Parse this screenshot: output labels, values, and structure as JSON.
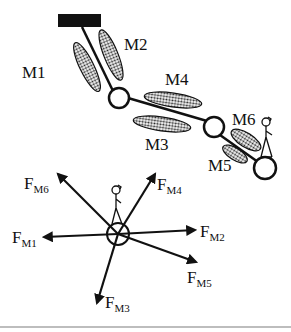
{
  "diagram": {
    "type": "arm-muscle-force-diagram",
    "colors": {
      "ink": "#111111",
      "muscle_fill": "#9a9a9a",
      "background": "#ffffff",
      "rule": "#bdbdbd"
    },
    "arm": {
      "anchor": "base-block",
      "joints": [
        "shoulder",
        "elbow",
        "endpoint"
      ],
      "muscles": [
        {
          "id": "M1",
          "label": "M1"
        },
        {
          "id": "M2",
          "label": "M2"
        },
        {
          "id": "M3",
          "label": "M3"
        },
        {
          "id": "M4",
          "label": "M4"
        },
        {
          "id": "M5",
          "label": "M5"
        },
        {
          "id": "M6",
          "label": "M6"
        }
      ]
    },
    "forces": {
      "prefix": "F",
      "vectors": [
        {
          "id": "FM6",
          "main": "F",
          "sub": "M6"
        },
        {
          "id": "FM4",
          "main": "F",
          "sub": "M4"
        },
        {
          "id": "FM1",
          "main": "F",
          "sub": "M1"
        },
        {
          "id": "FM2",
          "main": "F",
          "sub": "M2"
        },
        {
          "id": "FM5",
          "main": "F",
          "sub": "M5"
        },
        {
          "id": "FM3",
          "main": "F",
          "sub": "M3"
        }
      ]
    }
  }
}
